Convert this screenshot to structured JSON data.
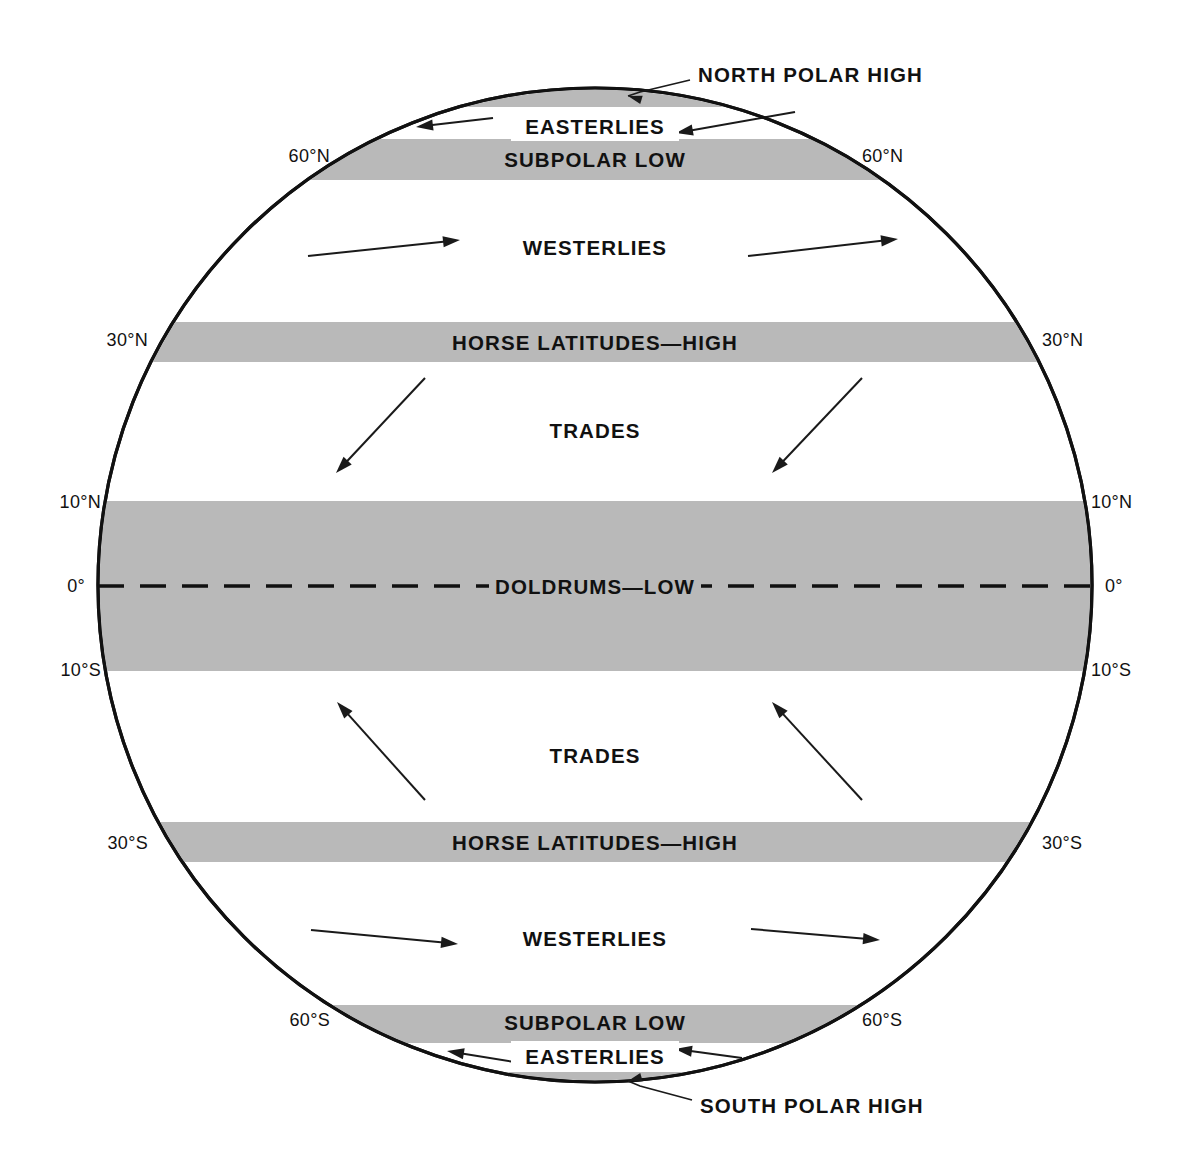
{
  "figure": {
    "kind": "global-wind-belts-diagram",
    "shape": "globe-circle",
    "colors": {
      "band_fill": "#b9b9b9",
      "outline": "#111111",
      "text": "#111111",
      "background": "#ffffff"
    }
  },
  "callouts": [
    {
      "id": "north-polar-high",
      "label": "NORTH POLAR HIGH",
      "text_x": 698,
      "text_y": 74,
      "line": "M 690,80 L 640,92 L 628,96",
      "head": {
        "x": 628,
        "y": 96,
        "angle": 196
      }
    },
    {
      "id": "south-polar-high",
      "label": "SOUTH POLAR HIGH",
      "text_x": 700,
      "text_y": 1105,
      "line": "M 692,1100 L 640,1086 L 628,1081",
      "head": {
        "x": 628,
        "y": 1081,
        "angle": 164
      }
    }
  ],
  "latitude_labels": [
    {
      "value": "60°N",
      "side": "left",
      "x": 330,
      "y": 156
    },
    {
      "value": "60°N",
      "side": "right",
      "x": 862,
      "y": 156
    },
    {
      "value": "30°N",
      "side": "left",
      "x": 148,
      "y": 340
    },
    {
      "value": "30°N",
      "side": "right",
      "x": 1042,
      "y": 340
    },
    {
      "value": "10°N",
      "side": "left",
      "x": 101,
      "y": 502
    },
    {
      "value": "10°N",
      "side": "right",
      "x": 1091,
      "y": 502
    },
    {
      "value": "0°",
      "side": "left",
      "x": 85,
      "y": 586
    },
    {
      "value": "0°",
      "side": "right",
      "x": 1105,
      "y": 586
    },
    {
      "value": "10°S",
      "side": "left",
      "x": 101,
      "y": 670
    },
    {
      "value": "10°S",
      "side": "right",
      "x": 1091,
      "y": 670
    },
    {
      "value": "30°S",
      "side": "left",
      "x": 148,
      "y": 843
    },
    {
      "value": "30°S",
      "side": "right",
      "x": 1042,
      "y": 843
    },
    {
      "value": "60°S",
      "side": "left",
      "x": 330,
      "y": 1020
    },
    {
      "value": "60°S",
      "side": "right",
      "x": 862,
      "y": 1020
    }
  ],
  "bands": [
    {
      "id": "north-polar-high-band",
      "label": "",
      "shaded": true,
      "y_top": 88,
      "y_bottom": 107,
      "label_y": 0
    },
    {
      "id": "northern-easterlies",
      "label": "EASTERLIES",
      "shaded": false,
      "y_top": 107,
      "y_bottom": 139,
      "label_y": 126
    },
    {
      "id": "north-subpolar-low",
      "label": "SUBPOLAR LOW",
      "shaded": true,
      "y_top": 139,
      "y_bottom": 180,
      "label_y": 159
    },
    {
      "id": "northern-westerlies",
      "label": "WESTERLIES",
      "shaded": false,
      "y_top": 180,
      "y_bottom": 322,
      "label_y": 247
    },
    {
      "id": "north-horse-latitudes",
      "label": "HORSE LATITUDES—HIGH",
      "shaded": true,
      "y_top": 322,
      "y_bottom": 362,
      "label_y": 342
    },
    {
      "id": "northern-trades",
      "label": "TRADES",
      "shaded": false,
      "y_top": 362,
      "y_bottom": 501,
      "label_y": 430
    },
    {
      "id": "doldrums-low",
      "label": "DOLDRUMS—LOW",
      "shaded": true,
      "y_top": 501,
      "y_bottom": 671,
      "label_y": 586
    },
    {
      "id": "southern-trades",
      "label": "TRADES",
      "shaded": false,
      "y_top": 671,
      "y_bottom": 822,
      "label_y": 755
    },
    {
      "id": "south-horse-latitudes",
      "label": "HORSE LATITUDES—HIGH",
      "shaded": true,
      "y_top": 822,
      "y_bottom": 862,
      "label_y": 842
    },
    {
      "id": "southern-westerlies",
      "label": "WESTERLIES",
      "shaded": false,
      "y_top": 862,
      "y_bottom": 1005,
      "label_y": 938
    },
    {
      "id": "south-subpolar-low",
      "label": "SUBPOLAR LOW",
      "shaded": true,
      "y_top": 1005,
      "y_bottom": 1043,
      "label_y": 1022
    },
    {
      "id": "southern-easterlies",
      "label": "EASTERLIES",
      "shaded": false,
      "y_top": 1043,
      "y_bottom": 1072,
      "label_y": 1056
    },
    {
      "id": "south-polar-high-band",
      "label": "",
      "shaded": true,
      "y_top": 1072,
      "y_bottom": 1082,
      "label_y": 0
    }
  ],
  "globe": {
    "cx": 595,
    "cy": 585,
    "r": 497
  },
  "equator": {
    "y": 586,
    "x1": 98,
    "x2": 1093
  },
  "wind_arrows": [
    {
      "id": "ne-easterly-left",
      "belt": "northern-easterlies",
      "x1": 493,
      "y1": 118,
      "x2": 416,
      "y2": 127
    },
    {
      "id": "ne-easterly-right",
      "belt": "northern-easterlies",
      "x1": 795,
      "y1": 112,
      "x2": 676,
      "y2": 133
    },
    {
      "id": "n-westerly-left",
      "belt": "northern-westerlies",
      "x1": 308,
      "y1": 256,
      "x2": 460,
      "y2": 240
    },
    {
      "id": "n-westerly-right",
      "belt": "northern-westerlies",
      "x1": 748,
      "y1": 256,
      "x2": 898,
      "y2": 239
    },
    {
      "id": "ne-trade-left",
      "belt": "northern-trades",
      "x1": 425,
      "y1": 378,
      "x2": 336,
      "y2": 473
    },
    {
      "id": "ne-trade-right",
      "belt": "northern-trades",
      "x1": 862,
      "y1": 378,
      "x2": 772,
      "y2": 473
    },
    {
      "id": "se-trade-left",
      "belt": "southern-trades",
      "x1": 425,
      "y1": 800,
      "x2": 337,
      "y2": 702
    },
    {
      "id": "se-trade-right",
      "belt": "southern-trades",
      "x1": 862,
      "y1": 800,
      "x2": 772,
      "y2": 702
    },
    {
      "id": "s-westerly-left",
      "belt": "southern-westerlies",
      "x1": 311,
      "y1": 930,
      "x2": 458,
      "y2": 944
    },
    {
      "id": "s-westerly-right",
      "belt": "southern-westerlies",
      "x1": 751,
      "y1": 929,
      "x2": 880,
      "y2": 940
    },
    {
      "id": "se-easterly-left",
      "belt": "southern-easterlies",
      "x1": 520,
      "y1": 1063,
      "x2": 447,
      "y2": 1051
    },
    {
      "id": "se-easterly-right",
      "belt": "southern-easterlies",
      "x1": 742,
      "y1": 1058,
      "x2": 675,
      "y2": 1049
    }
  ]
}
